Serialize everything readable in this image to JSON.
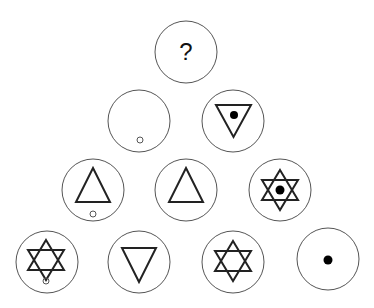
{
  "puzzle": {
    "description": "Triangular arrangement of circles containing symbols; top circle is unknown",
    "colors": {
      "circle_stroke": "#555555",
      "symbol_stroke": "#222222",
      "dot_fill": "#000000",
      "small_circle_stroke": "#555555"
    },
    "rows": [
      {
        "cells": [
          {
            "id": "r1c1",
            "cx": 186,
            "cy": 52,
            "label": "?",
            "symbols": [
              "question-mark"
            ]
          }
        ]
      },
      {
        "cells": [
          {
            "id": "r2c1",
            "cx": 139,
            "cy": 121,
            "symbols": [
              "small-circle"
            ]
          },
          {
            "id": "r2c2",
            "cx": 233,
            "cy": 121,
            "symbols": [
              "down-triangle",
              "dot"
            ]
          }
        ]
      },
      {
        "cells": [
          {
            "id": "r3c1",
            "cx": 93,
            "cy": 190,
            "symbols": [
              "up-triangle",
              "small-circle"
            ]
          },
          {
            "id": "r3c2",
            "cx": 186,
            "cy": 190,
            "symbols": [
              "up-triangle"
            ]
          },
          {
            "id": "r3c3",
            "cx": 280,
            "cy": 190,
            "symbols": [
              "hexagram",
              "dot"
            ]
          }
        ]
      },
      {
        "cells": [
          {
            "id": "r4c1",
            "cx": 47,
            "cy": 262,
            "symbols": [
              "hexagram",
              "small-circle"
            ]
          },
          {
            "id": "r4c2",
            "cx": 139,
            "cy": 262,
            "symbols": [
              "down-triangle"
            ]
          },
          {
            "id": "r4c3",
            "cx": 233,
            "cy": 262,
            "symbols": [
              "hexagram"
            ]
          },
          {
            "id": "r4c4",
            "cx": 328,
            "cy": 259,
            "symbols": [
              "dot"
            ]
          }
        ]
      }
    ]
  }
}
